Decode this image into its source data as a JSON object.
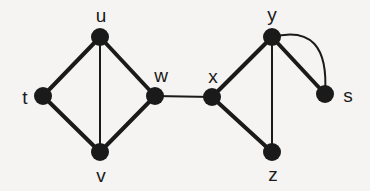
{
  "figure": {
    "name": "undirected-multigraph",
    "background_color": "#f5f4f2",
    "ink_color": "#1a1a1a",
    "width": 370,
    "height": 191
  },
  "chart_data": {
    "type": "diagram",
    "title": "",
    "graph_kind": "undirected multigraph",
    "node_radius": 9,
    "nodes": [
      {
        "id": "t",
        "label": "t",
        "x": 43,
        "y": 96,
        "label_x": 25,
        "label_y": 97
      },
      {
        "id": "u",
        "label": "u",
        "x": 100,
        "y": 37,
        "label_x": 101,
        "label_y": 15
      },
      {
        "id": "v",
        "label": "v",
        "x": 100,
        "y": 152,
        "label_x": 101,
        "label_y": 175
      },
      {
        "id": "w",
        "label": "w",
        "x": 155,
        "y": 96,
        "label_x": 161,
        "label_y": 75
      },
      {
        "id": "x",
        "label": "x",
        "x": 212,
        "y": 97,
        "label_x": 213,
        "label_y": 76
      },
      {
        "id": "y",
        "label": "y",
        "x": 272,
        "y": 37,
        "label_x": 272,
        "label_y": 14
      },
      {
        "id": "z",
        "label": "z",
        "x": 272,
        "y": 152,
        "label_x": 273,
        "label_y": 174
      },
      {
        "id": "s",
        "label": "s",
        "x": 325,
        "y": 94,
        "label_x": 348,
        "label_y": 95
      }
    ],
    "edges": [
      {
        "source": "t",
        "target": "u",
        "style": "straight",
        "width": 4
      },
      {
        "source": "u",
        "target": "w",
        "style": "straight",
        "width": 4
      },
      {
        "source": "t",
        "target": "v",
        "style": "straight",
        "width": 4
      },
      {
        "source": "v",
        "target": "w",
        "style": "straight",
        "width": 4
      },
      {
        "source": "u",
        "target": "v",
        "style": "straight",
        "width": 2
      },
      {
        "source": "w",
        "target": "x",
        "style": "straight",
        "width": 2
      },
      {
        "source": "x",
        "target": "y",
        "style": "straight",
        "width": 4
      },
      {
        "source": "x",
        "target": "z",
        "style": "straight",
        "width": 4
      },
      {
        "source": "y",
        "target": "z",
        "style": "straight",
        "width": 2
      },
      {
        "source": "y",
        "target": "s",
        "style": "straight",
        "width": 4
      },
      {
        "source": "y",
        "target": "s",
        "style": "curved",
        "width": 2,
        "curve_control_x": 330,
        "curve_control_y": 22
      }
    ]
  }
}
